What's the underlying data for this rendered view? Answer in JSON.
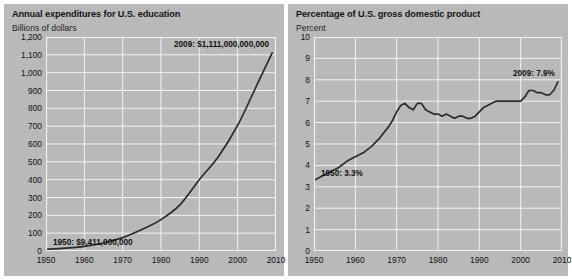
{
  "figure": {
    "background": "#ffffff",
    "panel_background": "#b9b9b9",
    "line_color": "#2b2b2b",
    "grid_color": "#f2f2f2"
  },
  "chart_data": [
    {
      "type": "line",
      "panel": "left",
      "title": "Annual expenditures for U.S. education",
      "subtitle": "Billions of dollars",
      "xlabel": "",
      "ylabel": "Billions of dollars",
      "xlim": [
        1950,
        2010
      ],
      "ylim": [
        0,
        1200
      ],
      "grid": true,
      "legend": "none",
      "yticks": [
        "1,200",
        "1,100",
        "1,000",
        "900",
        "800",
        "700",
        "600",
        "500",
        "400",
        "300",
        "200",
        "100",
        "0"
      ],
      "ytick_values": [
        1200,
        1100,
        1000,
        900,
        800,
        700,
        600,
        500,
        400,
        300,
        200,
        100,
        0
      ],
      "xticks": [
        "1950",
        "1960",
        "1970",
        "1980",
        "1990",
        "2000",
        "2010"
      ],
      "xtick_values": [
        1950,
        1960,
        1970,
        1980,
        1990,
        2000,
        2010
      ],
      "x": [
        1950,
        1955,
        1960,
        1965,
        1970,
        1975,
        1980,
        1985,
        1990,
        1995,
        2000,
        2005,
        2009
      ],
      "values": [
        9.4,
        16,
        26,
        45,
        75,
        120,
        176,
        260,
        400,
        530,
        705,
        930,
        1111
      ],
      "annotations": [
        {
          "name": "start-point",
          "text": "1950: $9,411,000,000",
          "x": 1950,
          "y": 9.4
        },
        {
          "name": "end-point",
          "text": "2009: $1,111,000,000,000",
          "x": 2009,
          "y": 1111
        }
      ]
    },
    {
      "type": "line",
      "panel": "right",
      "title": "Percentage of U.S. gross domestic product",
      "subtitle": "Percent",
      "xlabel": "",
      "ylabel": "Percent",
      "xlim": [
        1950,
        2010
      ],
      "ylim": [
        0,
        10
      ],
      "grid": true,
      "legend": "none",
      "yticks": [
        "10",
        "9",
        "8",
        "7",
        "6",
        "5",
        "4",
        "3",
        "2",
        "1",
        "0"
      ],
      "ytick_values": [
        10,
        9,
        8,
        7,
        6,
        5,
        4,
        3,
        2,
        1,
        0
      ],
      "xticks": [
        "1950",
        "1960",
        "1970",
        "1980",
        "1990",
        "2000",
        "2010"
      ],
      "xtick_values": [
        1950,
        1960,
        1970,
        1980,
        1990,
        2000,
        2010
      ],
      "x": [
        1950,
        1952,
        1954,
        1956,
        1958,
        1960,
        1962,
        1964,
        1966,
        1968,
        1969,
        1970,
        1971,
        1972,
        1973,
        1974,
        1975,
        1976,
        1977,
        1978,
        1979,
        1980,
        1981,
        1982,
        1983,
        1984,
        1985,
        1986,
        1987,
        1988,
        1989,
        1990,
        1991,
        1992,
        1993,
        1994,
        1995,
        1996,
        1997,
        1998,
        1999,
        2000,
        2001,
        2002,
        2003,
        2004,
        2005,
        2006,
        2007,
        2008,
        2009
      ],
      "values": [
        3.3,
        3.5,
        3.7,
        3.9,
        4.2,
        4.4,
        4.6,
        4.9,
        5.3,
        5.8,
        6.1,
        6.5,
        6.8,
        6.9,
        6.7,
        6.6,
        6.9,
        6.9,
        6.6,
        6.5,
        6.4,
        6.4,
        6.3,
        6.4,
        6.3,
        6.2,
        6.3,
        6.3,
        6.2,
        6.2,
        6.3,
        6.5,
        6.7,
        6.8,
        6.9,
        7.0,
        7.0,
        7.0,
        7.0,
        7.0,
        7.0,
        7.0,
        7.2,
        7.5,
        7.5,
        7.4,
        7.4,
        7.3,
        7.3,
        7.5,
        7.9
      ],
      "annotations": [
        {
          "name": "start-point",
          "text": "1950: 3.3%",
          "x": 1950,
          "y": 3.3
        },
        {
          "name": "end-point",
          "text": "2009: 7.9%",
          "x": 2009,
          "y": 7.9
        }
      ]
    }
  ]
}
